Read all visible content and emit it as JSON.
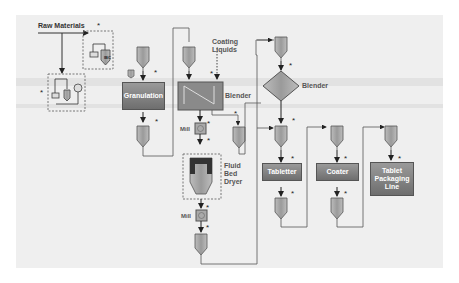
{
  "diagram": {
    "type": "process-flow",
    "labels": {
      "raw_materials": "Raw Materials",
      "coating_liquids_1": "Coating",
      "coating_liquids_2": "Liquids",
      "blender_1": "Blender",
      "blender_2": "Blender",
      "mill_1": "Mill",
      "mill_2": "Mill",
      "fluid_bed_dryer_1": "Fluid",
      "fluid_bed_dryer_2": "Bed",
      "fluid_bed_dryer_3": "Dryer",
      "ibc": "IBC",
      "weigh": "W"
    },
    "boxes": {
      "granulation": "Granulation",
      "tabletter": "Tabletter",
      "coater": "Coater",
      "packaging_1": "Tablet",
      "packaging_2": "Packaging",
      "packaging_3": "Line"
    },
    "marker": "*",
    "colors": {
      "background": "#efefef",
      "box_fill": "#808080",
      "line": "#444444"
    }
  }
}
